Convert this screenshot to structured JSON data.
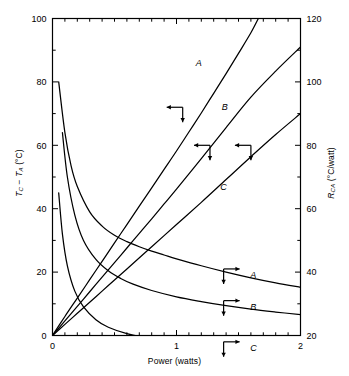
{
  "figure": {
    "background": "#ffffff",
    "ink": "#000000"
  },
  "axes": {
    "x": {
      "label": "Power (watts)",
      "min": 0,
      "max": 2,
      "ticks": [
        0,
        1,
        2
      ],
      "tick_labels": [
        "0",
        "1",
        "2"
      ],
      "minor_tick_step": 0.1
    },
    "y_left": {
      "label_parts": {
        "t": "T",
        "sub_c": "C",
        "minus": " − ",
        "t2": "T",
        "sub_a": "A",
        "unit": " (°C)"
      },
      "label": "T_C − T_A (°C)",
      "min": 0,
      "max": 100,
      "ticks": [
        0,
        20,
        40,
        60,
        80,
        100
      ],
      "tick_labels": [
        "0",
        "20",
        "40",
        "60",
        "80",
        "100"
      ],
      "minor_tick_step": 10
    },
    "y_right": {
      "label_parts": {
        "r": "R",
        "sub_ca": "CA",
        "unit": " (°C/watt)"
      },
      "label": "R_CA (°C/watt)",
      "min": 20,
      "max": 120,
      "ticks": [
        20,
        40,
        60,
        80,
        100,
        120
      ],
      "tick_labels": [
        "20",
        "40",
        "60",
        "80",
        "100",
        "120"
      ],
      "minor_tick_step": 10
    }
  },
  "chart_data": {
    "type": "line",
    "title": "",
    "xlabel": "Power (watts)",
    "ylabel": "T_C − T_A (°C)",
    "ylabel_right": "R_CA (°C/watt)",
    "xlim": [
      0,
      2
    ],
    "ylim": [
      0,
      100
    ],
    "ylim_right": [
      20,
      120
    ],
    "grid": false,
    "legend": "inline-curve-labels",
    "series": [
      {
        "name": "A",
        "axis": "left",
        "kind": "rising",
        "label_text": "A",
        "label_x": 1.18,
        "label_y": 86,
        "arrow": {
          "direction": "left-down",
          "x": 1.05,
          "y": 72
        },
        "points": [
          [
            0.0,
            0.0
          ],
          [
            0.1,
            6.0
          ],
          [
            0.2,
            11.8
          ],
          [
            0.3,
            17.6
          ],
          [
            0.4,
            23.4
          ],
          [
            0.5,
            29.2
          ],
          [
            0.6,
            35.0
          ],
          [
            0.7,
            40.8
          ],
          [
            0.8,
            46.6
          ],
          [
            0.9,
            52.4
          ],
          [
            1.0,
            58.2
          ],
          [
            1.1,
            64.2
          ],
          [
            1.2,
            70.2
          ],
          [
            1.3,
            76.4
          ],
          [
            1.4,
            82.6
          ],
          [
            1.5,
            89.0
          ],
          [
            1.6,
            95.5
          ],
          [
            1.66,
            100.0
          ]
        ]
      },
      {
        "name": "B",
        "axis": "left",
        "kind": "rising",
        "label_text": "B",
        "label_x": 1.39,
        "label_y": 72,
        "arrow": {
          "direction": "left-down",
          "x": 1.27,
          "y": 60
        },
        "points": [
          [
            0.0,
            0.0
          ],
          [
            0.1,
            4.6
          ],
          [
            0.2,
            9.2
          ],
          [
            0.3,
            13.8
          ],
          [
            0.4,
            18.4
          ],
          [
            0.5,
            23.0
          ],
          [
            0.6,
            27.6
          ],
          [
            0.7,
            32.2
          ],
          [
            0.8,
            36.8
          ],
          [
            0.9,
            41.5
          ],
          [
            1.0,
            46.2
          ],
          [
            1.2,
            55.8
          ],
          [
            1.4,
            65.6
          ],
          [
            1.6,
            75.2
          ],
          [
            1.8,
            83.4
          ],
          [
            2.0,
            91.0
          ]
        ]
      },
      {
        "name": "C",
        "axis": "left",
        "kind": "rising",
        "label_text": "C",
        "label_x": 1.38,
        "label_y": 47,
        "arrow": {
          "direction": "left-down",
          "x": 1.6,
          "y": 60
        },
        "points": [
          [
            0.0,
            0.0
          ],
          [
            0.1,
            3.5
          ],
          [
            0.2,
            7.0
          ],
          [
            0.3,
            10.5
          ],
          [
            0.4,
            14.0
          ],
          [
            0.5,
            17.5
          ],
          [
            0.6,
            21.0
          ],
          [
            0.8,
            28.0
          ],
          [
            1.0,
            35.0
          ],
          [
            1.2,
            42.0
          ],
          [
            1.4,
            49.2
          ],
          [
            1.6,
            56.4
          ],
          [
            1.8,
            63.4
          ],
          [
            2.0,
            70.0
          ]
        ]
      },
      {
        "name": "A",
        "axis": "right",
        "kind": "falling",
        "label_text": "A",
        "label_x": 1.62,
        "label_y": 39,
        "arrow": {
          "direction": "right-down",
          "x": 1.38,
          "y": 41
        },
        "points": [
          [
            0.05,
            100.0
          ],
          [
            0.1,
            84.0
          ],
          [
            0.15,
            73.5
          ],
          [
            0.2,
            67.0
          ],
          [
            0.3,
            59.0
          ],
          [
            0.4,
            54.5
          ],
          [
            0.5,
            51.6
          ],
          [
            0.6,
            49.6
          ],
          [
            0.7,
            48.0
          ],
          [
            0.8,
            46.6
          ],
          [
            0.9,
            45.4
          ],
          [
            1.0,
            44.2
          ],
          [
            1.2,
            42.0
          ],
          [
            1.4,
            40.0
          ],
          [
            1.6,
            38.2
          ],
          [
            1.8,
            36.6
          ],
          [
            2.0,
            35.2
          ]
        ]
      },
      {
        "name": "B",
        "axis": "right",
        "kind": "falling",
        "label_text": "B",
        "label_x": 1.62,
        "label_y": 29,
        "arrow": {
          "direction": "right-down",
          "x": 1.38,
          "y": 31
        },
        "points": [
          [
            0.08,
            84.0
          ],
          [
            0.12,
            70.0
          ],
          [
            0.18,
            58.0
          ],
          [
            0.25,
            50.0
          ],
          [
            0.35,
            44.0
          ],
          [
            0.45,
            40.4
          ],
          [
            0.55,
            38.0
          ],
          [
            0.65,
            36.2
          ],
          [
            0.8,
            34.2
          ],
          [
            1.0,
            32.2
          ],
          [
            1.2,
            30.7
          ],
          [
            1.4,
            29.4
          ],
          [
            1.6,
            28.3
          ],
          [
            1.8,
            27.4
          ],
          [
            2.0,
            26.6
          ]
        ]
      },
      {
        "name": "C",
        "axis": "right",
        "kind": "falling",
        "label_text": "C",
        "label_x": 1.62,
        "label_y": 16,
        "arrow": {
          "direction": "right-down",
          "x": 1.38,
          "y": 18
        },
        "points": [
          [
            0.05,
            65.0
          ],
          [
            0.08,
            52.0
          ],
          [
            0.12,
            42.0
          ],
          [
            0.18,
            34.0
          ],
          [
            0.25,
            29.0
          ],
          [
            0.35,
            25.0
          ],
          [
            0.45,
            22.6
          ],
          [
            0.6,
            20.6
          ],
          [
            0.8,
            19.0
          ],
          [
            1.0,
            18.0
          ],
          [
            1.2,
            17.2
          ],
          [
            1.4,
            16.6
          ],
          [
            1.6,
            16.0
          ],
          [
            1.8,
            15.5
          ],
          [
            2.0,
            15.0
          ]
        ]
      }
    ]
  }
}
